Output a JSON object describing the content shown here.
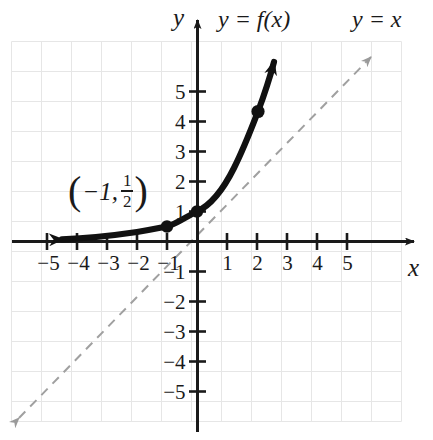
{
  "figure": {
    "title_label": "y = f(x)",
    "identity_label": "y = x",
    "x_axis_name": "x",
    "y_axis_name": "y",
    "point_label": {
      "open_paren": "(",
      "x_value": "−1,",
      "numerator": "1",
      "denominator": "2",
      "close_paren": ")"
    }
  },
  "axes": {
    "x_ticks": [
      {
        "value": -5,
        "label": "−5"
      },
      {
        "value": -4,
        "label": "−4"
      },
      {
        "value": -3,
        "label": "−3"
      },
      {
        "value": -2,
        "label": "−2"
      },
      {
        "value": -1,
        "label": "−1"
      },
      {
        "value": 1,
        "label": "1"
      },
      {
        "value": 2,
        "label": "2"
      },
      {
        "value": 3,
        "label": "3"
      },
      {
        "value": 4,
        "label": "4"
      },
      {
        "value": 5,
        "label": "5"
      }
    ],
    "y_ticks": [
      {
        "value": 5,
        "label": "5"
      },
      {
        "value": 4,
        "label": "4"
      },
      {
        "value": 3,
        "label": "3"
      },
      {
        "value": 2,
        "label": "2"
      },
      {
        "value": 1,
        "label": "1"
      },
      {
        "value": -1,
        "label": "−1"
      },
      {
        "value": -2,
        "label": "−2"
      },
      {
        "value": -3,
        "label": "−3"
      },
      {
        "value": -4,
        "label": "−4"
      },
      {
        "value": -5,
        "label": "−5"
      }
    ]
  },
  "chart_data": {
    "type": "line",
    "title": "y = f(x)",
    "xlabel": "x",
    "ylabel": "y",
    "xlim": [
      -6.2,
      7.4
    ],
    "ylim": [
      -6.6,
      7.4
    ],
    "grid": true,
    "grid_spacing": 1,
    "legend": "none",
    "series": [
      {
        "name": "y = f(x)",
        "style": "solid",
        "color": "#111111",
        "width": "thick",
        "equation": "y = 2^x",
        "arrows": [
          "start",
          "end"
        ],
        "asymptote": "y = 0",
        "x": [
          -5.0,
          -4.5,
          -4.0,
          -3.5,
          -3.0,
          -2.5,
          -2.0,
          -1.5,
          -1.0,
          -0.5,
          0.0,
          0.5,
          1.0,
          1.5,
          2.0,
          2.35
        ],
        "y": [
          0.031,
          0.044,
          0.063,
          0.088,
          0.125,
          0.177,
          0.25,
          0.354,
          0.5,
          0.707,
          1.0,
          1.414,
          2.0,
          2.828,
          4.0,
          5.1
        ]
      },
      {
        "name": "y = x",
        "style": "dashed",
        "color": "#9a9a9a",
        "width": "thin",
        "equation": "y = x",
        "arrows": [
          "start",
          "end"
        ],
        "x": [
          -5.9,
          5.8
        ],
        "y": [
          -5.9,
          5.8
        ]
      }
    ],
    "points": [
      {
        "x": -1,
        "y": 0.5,
        "label": "(−1, 1/2)",
        "labeled": true
      },
      {
        "x": 0,
        "y": 1,
        "label": "(0, 1)",
        "labeled": false
      },
      {
        "x": 2,
        "y": 4,
        "label": "(2, 4)",
        "labeled": false
      }
    ],
    "annotations": [
      {
        "text": "y = f(x)",
        "x": 1.4,
        "y": 6.9
      },
      {
        "text": "y = x",
        "x": 5.9,
        "y": 6.9
      },
      {
        "text": "(−1, 1/2)",
        "x": -3.1,
        "y": 1.55
      }
    ]
  }
}
